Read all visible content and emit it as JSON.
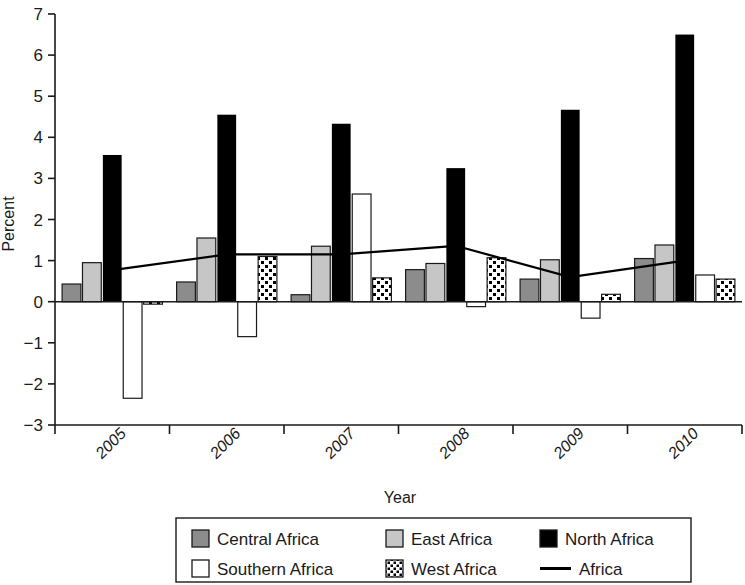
{
  "chart_data": {
    "type": "bar",
    "title": "",
    "xlabel": "Year",
    "ylabel": "Percent",
    "categories": [
      "2005",
      "2006",
      "2007",
      "2008",
      "2009",
      "2010"
    ],
    "ylim": [
      -3,
      7
    ],
    "ytick_labels": [
      "7",
      "6",
      "5",
      "4",
      "3",
      "2",
      "1",
      "0",
      "−1",
      "−2",
      "−3"
    ],
    "ytick_values": [
      7,
      6,
      5,
      4,
      3,
      2,
      1,
      0,
      -1,
      -2,
      -3
    ],
    "grid": false,
    "legend_position": "bottom",
    "series": [
      {
        "name": "Central Africa",
        "kind": "bar",
        "fill": "#8c8c8c",
        "pattern": "solid",
        "values": [
          0.43,
          0.48,
          0.17,
          0.78,
          0.55,
          1.05
        ]
      },
      {
        "name": "East Africa",
        "kind": "bar",
        "fill": "#c6c6c6",
        "pattern": "solid",
        "values": [
          0.95,
          1.55,
          1.35,
          0.93,
          1.02,
          1.38
        ]
      },
      {
        "name": "North Africa",
        "kind": "bar",
        "fill": "#000000",
        "pattern": "solid",
        "values": [
          3.57,
          4.55,
          4.33,
          3.25,
          4.67,
          6.5
        ]
      },
      {
        "name": "Southern Africa",
        "kind": "bar",
        "fill": "#ffffff",
        "pattern": "solid",
        "values": [
          -2.35,
          -0.85,
          2.62,
          -0.12,
          -0.4,
          0.65
        ]
      },
      {
        "name": "West Africa",
        "kind": "bar",
        "fill": "#ffffff",
        "pattern": "checker",
        "values": [
          -0.06,
          1.1,
          0.58,
          1.07,
          0.18,
          0.55
        ]
      },
      {
        "name": "Africa",
        "kind": "line",
        "fill": "#000000",
        "pattern": "line",
        "values": [
          0.77,
          1.15,
          1.15,
          1.36,
          0.6,
          1.0
        ]
      }
    ],
    "legend_entries": [
      {
        "label": "Central Africa",
        "swatch": "dark-gray-square"
      },
      {
        "label": "East Africa",
        "swatch": "light-gray-square"
      },
      {
        "label": "North Africa",
        "swatch": "black-square"
      },
      {
        "label": "Southern Africa",
        "swatch": "white-square"
      },
      {
        "label": "West Africa",
        "swatch": "checker-square"
      },
      {
        "label": "Africa",
        "swatch": "black-line"
      }
    ]
  },
  "colors": {
    "central": "#8c8c8c",
    "east": "#c6c6c6",
    "north": "#000000",
    "southern": "#ffffff",
    "west_bg": "#ffffff",
    "west_dot": "#000000",
    "line": "#000000",
    "axis": "#1a1a1a",
    "background": "#ffffff"
  }
}
